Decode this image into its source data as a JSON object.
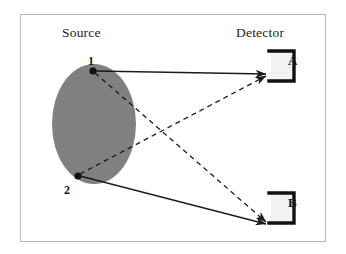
{
  "figure": {
    "background_color": "#ffffff",
    "frame_color": "#b9b9b9",
    "ink_color": "#1b1b1b",
    "source_fill_color": "#808080"
  },
  "headings": {
    "source": "Source",
    "detector": "Detector"
  },
  "source": {
    "shape": "ellipse",
    "fill": "#808080",
    "center_x": 94,
    "center_y": 124,
    "radius_x": 42,
    "radius_y": 60,
    "points": [
      {
        "id": "1",
        "label": "1",
        "x": 93,
        "y": 71
      },
      {
        "id": "2",
        "label": "2",
        "x": 78,
        "y": 176
      }
    ]
  },
  "detectors": [
    {
      "id": "A",
      "label": "A",
      "x": 272,
      "y": 66,
      "width": 22,
      "height": 30
    },
    {
      "id": "B",
      "label": "B",
      "x": 272,
      "y": 208,
      "width": 22,
      "height": 30
    }
  ],
  "paths": [
    {
      "name": "path-1-to-A",
      "from": "1",
      "to": "A",
      "style": "solid",
      "arrow": true
    },
    {
      "name": "path-2-to-B",
      "from": "2",
      "to": "B",
      "style": "solid",
      "arrow": true
    },
    {
      "name": "path-1-to-B",
      "from": "1",
      "to": "B",
      "style": "dashed",
      "arrow": true
    },
    {
      "name": "path-2-to-A",
      "from": "2",
      "to": "A",
      "style": "dashed",
      "arrow": true
    }
  ]
}
